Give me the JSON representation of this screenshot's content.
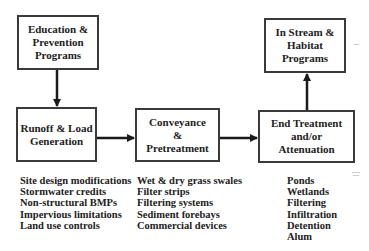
{
  "diagram": {
    "boxes": {
      "education": {
        "lines": [
          "Education &",
          "Prevention",
          "Programs"
        ]
      },
      "runoff": {
        "lines": [
          "Runoff & Load",
          "Generation"
        ]
      },
      "conveyance": {
        "lines": [
          "Conveyance",
          "&",
          "Pretreatment"
        ]
      },
      "end_treatment": {
        "lines": [
          "End Treatment",
          "and/or",
          "Attenuation"
        ]
      },
      "in_stream": {
        "lines": [
          "In Stream &",
          "Habitat",
          "Programs"
        ]
      }
    },
    "lists": {
      "runoff_items": [
        "Site design modifications",
        "Stormwater credits",
        "Non-structural BMPs",
        "Impervious limitations",
        "Land use controls"
      ],
      "conveyance_items": [
        "Wet & dry grass swales",
        "Filter strips",
        "Filtering systems",
        "Sediment forebays",
        "Commercial devices"
      ],
      "end_treatment_items": [
        "Ponds",
        "Wetlands",
        "Filtering",
        "Infiltration",
        "Detention",
        "Alum"
      ]
    },
    "arrows": [
      {
        "from": "education",
        "to": "runoff"
      },
      {
        "from": "runoff",
        "to": "conveyance"
      },
      {
        "from": "conveyance",
        "to": "end_treatment"
      },
      {
        "from": "end_treatment",
        "to": "in_stream"
      }
    ],
    "colors": {
      "line": "#1a1a1a",
      "border": "#3a3a3a",
      "text": "#222222"
    }
  }
}
